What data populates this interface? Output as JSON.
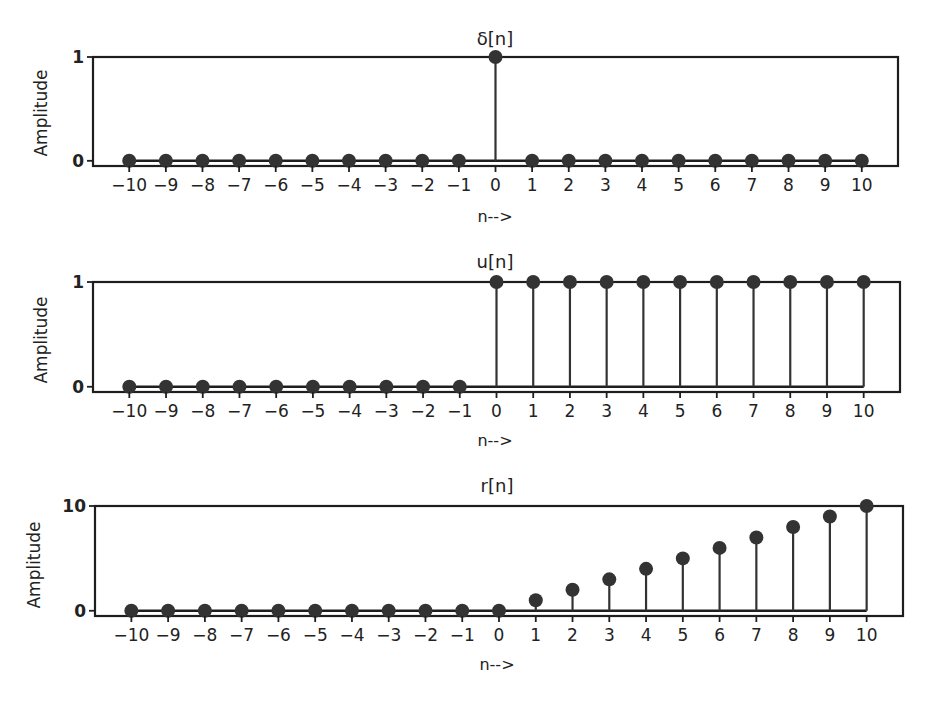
{
  "chart_data": [
    {
      "type": "stem",
      "title": "δ[n]",
      "xlabel": "n-->",
      "ylabel": "Amplitude",
      "x": [
        -10,
        -9,
        -8,
        -7,
        -6,
        -5,
        -4,
        -3,
        -2,
        -1,
        0,
        1,
        2,
        3,
        4,
        5,
        6,
        7,
        8,
        9,
        10
      ],
      "values": [
        0,
        0,
        0,
        0,
        0,
        0,
        0,
        0,
        0,
        0,
        1,
        0,
        0,
        0,
        0,
        0,
        0,
        0,
        0,
        0,
        0
      ],
      "xticks": [
        "−10",
        "−9",
        "−8",
        "−7",
        "−6",
        "−5",
        "−4",
        "−3",
        "−2",
        "−1",
        "0",
        "1",
        "2",
        "3",
        "4",
        "5",
        "6",
        "7",
        "8",
        "9",
        "10"
      ],
      "yticks": [
        0,
        1
      ],
      "ytick_labels": [
        "0",
        "1"
      ],
      "ylim": [
        -0.05,
        1.0
      ],
      "grid": false,
      "marker_color": "#333333"
    },
    {
      "type": "stem",
      "title": "u[n]",
      "xlabel": "n-->",
      "ylabel": "Amplitude",
      "x": [
        -10,
        -9,
        -8,
        -7,
        -6,
        -5,
        -4,
        -3,
        -2,
        -1,
        0,
        1,
        2,
        3,
        4,
        5,
        6,
        7,
        8,
        9,
        10
      ],
      "values": [
        0,
        0,
        0,
        0,
        0,
        0,
        0,
        0,
        0,
        0,
        1,
        1,
        1,
        1,
        1,
        1,
        1,
        1,
        1,
        1,
        1
      ],
      "xticks": [
        "−10",
        "−9",
        "−8",
        "−7",
        "−6",
        "−5",
        "−4",
        "−3",
        "−2",
        "−1",
        "0",
        "1",
        "2",
        "3",
        "4",
        "5",
        "6",
        "7",
        "8",
        "9",
        "10"
      ],
      "yticks": [
        0,
        1
      ],
      "ytick_labels": [
        "0",
        "1"
      ],
      "ylim": [
        -0.05,
        1.0
      ],
      "grid": false,
      "marker_color": "#333333"
    },
    {
      "type": "stem",
      "title": "r[n]",
      "xlabel": "n-->",
      "ylabel": "Amplitude",
      "x": [
        -10,
        -9,
        -8,
        -7,
        -6,
        -5,
        -4,
        -3,
        -2,
        -1,
        0,
        1,
        2,
        3,
        4,
        5,
        6,
        7,
        8,
        9,
        10
      ],
      "values": [
        0,
        0,
        0,
        0,
        0,
        0,
        0,
        0,
        0,
        0,
        0,
        1,
        2,
        3,
        4,
        5,
        6,
        7,
        8,
        9,
        10
      ],
      "xticks": [
        "−10",
        "−9",
        "−8",
        "−7",
        "−6",
        "−5",
        "−4",
        "−3",
        "−2",
        "−1",
        "0",
        "1",
        "2",
        "3",
        "4",
        "5",
        "6",
        "7",
        "8",
        "9",
        "10"
      ],
      "yticks": [
        0,
        10
      ],
      "ytick_labels": [
        "0",
        "10"
      ],
      "ylim": [
        -0.5,
        10.0
      ],
      "grid": false,
      "marker_color": "#333333"
    }
  ]
}
